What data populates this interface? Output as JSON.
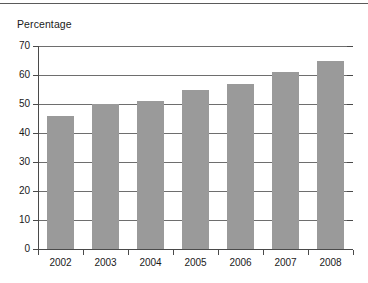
{
  "figure": {
    "name": "percentage-bar-chart",
    "has_top_rule": true,
    "background_color": "#ffffff"
  },
  "chart_data": {
    "type": "bar",
    "title": "",
    "ylabel": "Percentage",
    "xlabel": "",
    "categories": [
      "2002",
      "2003",
      "2004",
      "2005",
      "2006",
      "2007",
      "2008"
    ],
    "values": [
      46,
      50,
      51,
      55,
      57,
      61,
      65
    ],
    "ylim": [
      0,
      70
    ],
    "ytick_labels": [
      "0",
      "10",
      "20",
      "30",
      "40",
      "50",
      "60",
      "70"
    ],
    "ytick_values": [
      0,
      10,
      20,
      30,
      40,
      50,
      60,
      70
    ],
    "grid": "horizontal",
    "legend": "none",
    "bar_color": "#9a9a9a",
    "axis_color": "#4a4a4a",
    "gridline_color": "#6e6e6e"
  }
}
